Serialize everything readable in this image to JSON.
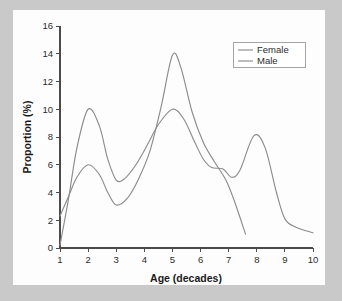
{
  "figure": {
    "background_color": "#c9c9c9",
    "panel_color": "#fdfdfd",
    "axis_color": "#4b4b4b"
  },
  "chart_data": {
    "type": "line",
    "title": "",
    "xlabel": "Age (decades)",
    "ylabel": "Proportion (%)",
    "xlim": [
      1,
      10
    ],
    "ylim": [
      0,
      16
    ],
    "xticks": [
      1,
      2,
      3,
      4,
      5,
      6,
      7,
      8,
      9,
      10
    ],
    "yticks": [
      0,
      2,
      4,
      6,
      8,
      10,
      12,
      14,
      16
    ],
    "xtick_labels": [
      "1",
      "2",
      "3",
      "4",
      "5",
      "6",
      "7",
      "8",
      "9",
      "10"
    ],
    "ytick_labels": [
      "0",
      "2",
      "4",
      "6",
      "8",
      "10",
      "12",
      "14",
      "16"
    ],
    "grid": false,
    "legend_position": "top-right",
    "series": [
      {
        "name": "Female",
        "color": "#8c8c8c",
        "x": [
          1.0,
          1.3,
          1.6,
          2.0,
          2.4,
          2.7,
          3.0,
          3.4,
          3.8,
          4.2,
          4.6,
          5.0,
          5.3,
          5.7,
          6.1,
          6.5,
          6.9,
          7.2,
          7.6
        ],
        "values": [
          2.3,
          3.7,
          5.1,
          6.0,
          5.3,
          4.0,
          3.1,
          3.6,
          5.0,
          7.0,
          10.2,
          13.9,
          13.0,
          9.8,
          7.6,
          6.2,
          4.9,
          3.4,
          1.0
        ]
      },
      {
        "name": "Male",
        "color": "#8c8c8c",
        "x": [
          1.0,
          1.3,
          1.6,
          2.0,
          2.4,
          2.7,
          3.0,
          3.3,
          3.7,
          4.1,
          4.5,
          5.0,
          5.4,
          5.8,
          6.1,
          6.4,
          6.8,
          7.1,
          7.4,
          7.9,
          8.3,
          8.7,
          9.0,
          9.4,
          10.0
        ],
        "values": [
          0.2,
          3.5,
          7.2,
          10.0,
          8.8,
          6.4,
          4.9,
          5.0,
          6.0,
          7.4,
          8.9,
          10.0,
          9.3,
          7.6,
          6.4,
          5.8,
          5.7,
          5.1,
          5.6,
          8.1,
          7.2,
          4.0,
          2.1,
          1.5,
          1.1
        ]
      }
    ],
    "legend_entries": [
      {
        "label": "Female",
        "color": "#8c8c8c"
      },
      {
        "label": "Male",
        "color": "#8c8c8c"
      }
    ]
  }
}
